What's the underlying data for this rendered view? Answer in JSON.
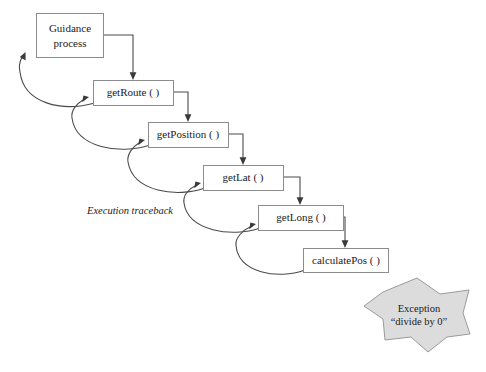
{
  "diagram": {
    "type": "call-stack-traceback",
    "traceback_label": "Execution traceback",
    "boxes": [
      {
        "id": "guidance",
        "label_line1": "Guidance",
        "label_line2": "process",
        "x": 36,
        "y": 13,
        "w": 67,
        "h": 44
      },
      {
        "id": "getroute",
        "label_line1": "getRoute ( )",
        "label_line2": "",
        "x": 93,
        "y": 80,
        "w": 80,
        "h": 25
      },
      {
        "id": "getposition",
        "label_line1": "getPosition ( )",
        "label_line2": "",
        "x": 148,
        "y": 122,
        "w": 80,
        "h": 25
      },
      {
        "id": "getlat",
        "label_line1": "getLat ( )",
        "label_line2": "",
        "x": 203,
        "y": 165,
        "w": 80,
        "h": 25
      },
      {
        "id": "getlong",
        "label_line1": "getLong ( )",
        "label_line2": "",
        "x": 258,
        "y": 205,
        "w": 85,
        "h": 25
      },
      {
        "id": "calculatepos",
        "label_line1": "calculatePos ( )",
        "label_line2": "",
        "x": 303,
        "y": 248,
        "w": 85,
        "h": 24
      }
    ],
    "call_edges": [
      {
        "from": "guidance",
        "to": "getroute"
      },
      {
        "from": "getroute",
        "to": "getposition"
      },
      {
        "from": "getposition",
        "to": "getlat"
      },
      {
        "from": "getlat",
        "to": "getlong"
      },
      {
        "from": "getlong",
        "to": "calculatepos"
      }
    ],
    "return_edges": [
      {
        "from": "getroute",
        "to": "guidance"
      },
      {
        "from": "getposition",
        "to": "getroute"
      },
      {
        "from": "getlat",
        "to": "getposition"
      },
      {
        "from": "getlong",
        "to": "getlat"
      },
      {
        "from": "calculatepos",
        "to": "getlong"
      }
    ],
    "exception": {
      "title": "Exception",
      "detail": "“divide by 0”",
      "shape": "seven-point-star"
    },
    "colors": {
      "box_fill": "#ffffff",
      "box_stroke": "#8c8c8c",
      "line": "#4a4a4a",
      "star_fill": "#dcdcdc",
      "star_stroke": "#9a9a9a",
      "text": "#1a1a1a"
    }
  }
}
